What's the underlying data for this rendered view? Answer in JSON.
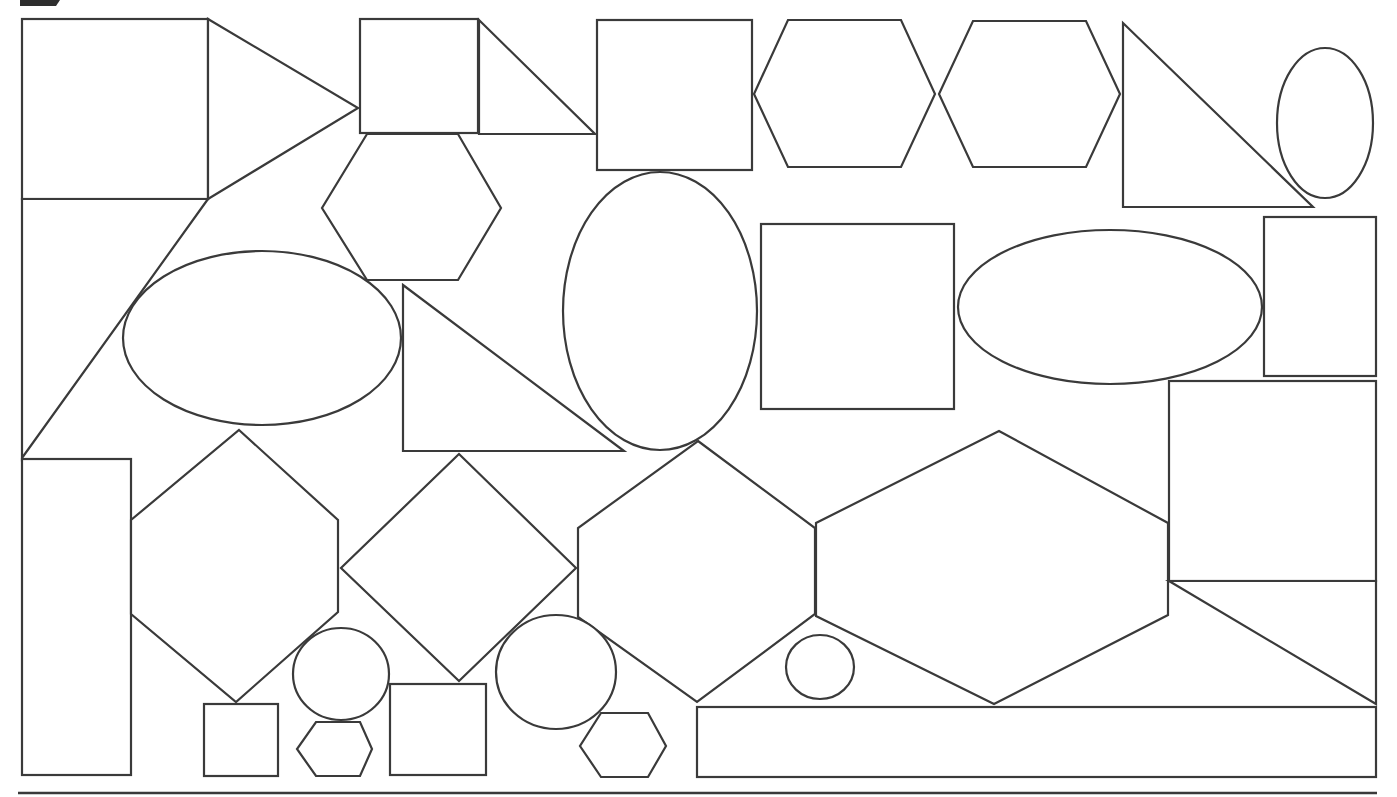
{
  "page": {
    "background": "#ffffff",
    "stroke_color": "#3a3a3a",
    "header_tab_color": "#2e2e2e"
  },
  "header_tab": {
    "points": "20,0 60,0 56,6 20,6"
  },
  "bottom_rule": {
    "x1": 18,
    "y1": 793,
    "x2": 1377,
    "y2": 793
  },
  "shapes": [
    {
      "id": "square-top-left",
      "type": "rect",
      "x": 22,
      "y": 19,
      "w": 186,
      "h": 180
    },
    {
      "id": "triangle-pointing-right",
      "type": "polygon",
      "points": "208,19 358,108 208,199"
    },
    {
      "id": "small-square-top",
      "type": "rect",
      "x": 360,
      "y": 19,
      "w": 118,
      "h": 114
    },
    {
      "id": "right-triangle-top",
      "type": "polygon",
      "points": "479,20 595,134 479,134"
    },
    {
      "id": "square-top-center",
      "type": "rect",
      "x": 597,
      "y": 20,
      "w": 155,
      "h": 150
    },
    {
      "id": "hexagon-top-1",
      "type": "polygon",
      "points": "788,20 901,20 935,94 901,167 788,167 754,94"
    },
    {
      "id": "hexagon-top-2",
      "type": "polygon",
      "points": "973,21 1086,21 1120,94 1086,167 973,167 939,94"
    },
    {
      "id": "right-triangle-top-right",
      "type": "polygon",
      "points": "1123,23 1313,207 1123,207"
    },
    {
      "id": "ellipse-top-right",
      "type": "ellipse",
      "cx": 1325,
      "cy": 123,
      "rx": 48,
      "ry": 75
    },
    {
      "id": "hexagon-upper-left",
      "type": "polygon",
      "points": "367,134 458,134 501,208 458,280 367,280 322,208"
    },
    {
      "id": "large-triangle-left",
      "type": "polygon",
      "points": "22,199 208,199 22,458"
    },
    {
      "id": "ellipse-left",
      "type": "ellipse",
      "cx": 262,
      "cy": 338,
      "rx": 139,
      "ry": 87
    },
    {
      "id": "right-triangle-middle",
      "type": "polygon",
      "points": "403,285 624,451 403,451"
    },
    {
      "id": "tall-ellipse-center",
      "type": "ellipse",
      "cx": 660,
      "cy": 311,
      "rx": 97,
      "ry": 139
    },
    {
      "id": "square-middle",
      "type": "rect",
      "x": 761,
      "y": 224,
      "w": 193,
      "h": 185
    },
    {
      "id": "wide-ellipse-right",
      "type": "ellipse",
      "cx": 1110,
      "cy": 307,
      "rx": 152,
      "ry": 77
    },
    {
      "id": "tall-rect-right",
      "type": "rect",
      "x": 1264,
      "y": 217,
      "w": 112,
      "h": 159
    },
    {
      "id": "square-right",
      "type": "rect",
      "x": 1169,
      "y": 381,
      "w": 207,
      "h": 200
    },
    {
      "id": "tall-rect-bottom-left",
      "type": "rect",
      "x": 22,
      "y": 459,
      "w": 109,
      "h": 316
    },
    {
      "id": "tall-hexagon-left",
      "type": "polygon",
      "points": "239,430 338,520 338,612 236,702 131,614 131,520"
    },
    {
      "id": "diamond-center-left",
      "type": "polygon",
      "points": "459,454 576,568 459,681 341,568"
    },
    {
      "id": "tall-hexagon-center",
      "type": "polygon",
      "points": "698,441 815,528 815,614 697,702 578,617 578,528"
    },
    {
      "id": "wide-hexagon-right",
      "type": "polygon",
      "points": "999,431 1168,523 1168,615 994,704 816,616 816,523"
    },
    {
      "id": "right-triangle-bottom-right",
      "type": "polygon",
      "points": "1169,581 1376,704 1376,581"
    },
    {
      "id": "circle-bottom-left",
      "type": "ellipse",
      "cx": 341,
      "cy": 674,
      "rx": 48,
      "ry": 46
    },
    {
      "id": "small-square-bottom-left",
      "type": "rect",
      "x": 204,
      "y": 704,
      "w": 74,
      "h": 72
    },
    {
      "id": "small-hexagon-bottom-left",
      "type": "polygon",
      "points": "316,722 360,722 372,749 360,776 316,776 297,749"
    },
    {
      "id": "square-bottom",
      "type": "rect",
      "x": 390,
      "y": 684,
      "w": 96,
      "h": 91
    },
    {
      "id": "circle-bottom-center",
      "type": "ellipse",
      "cx": 556,
      "cy": 672,
      "rx": 60,
      "ry": 57
    },
    {
      "id": "small-hexagon-bottom-center",
      "type": "polygon",
      "points": "601,713 648,713 666,746 648,777 601,777 580,746"
    },
    {
      "id": "small-circle-bottom",
      "type": "ellipse",
      "cx": 820,
      "cy": 667,
      "rx": 34,
      "ry": 32
    },
    {
      "id": "long-rect-bottom",
      "type": "rect",
      "x": 697,
      "y": 707,
      "w": 679,
      "h": 70
    }
  ]
}
